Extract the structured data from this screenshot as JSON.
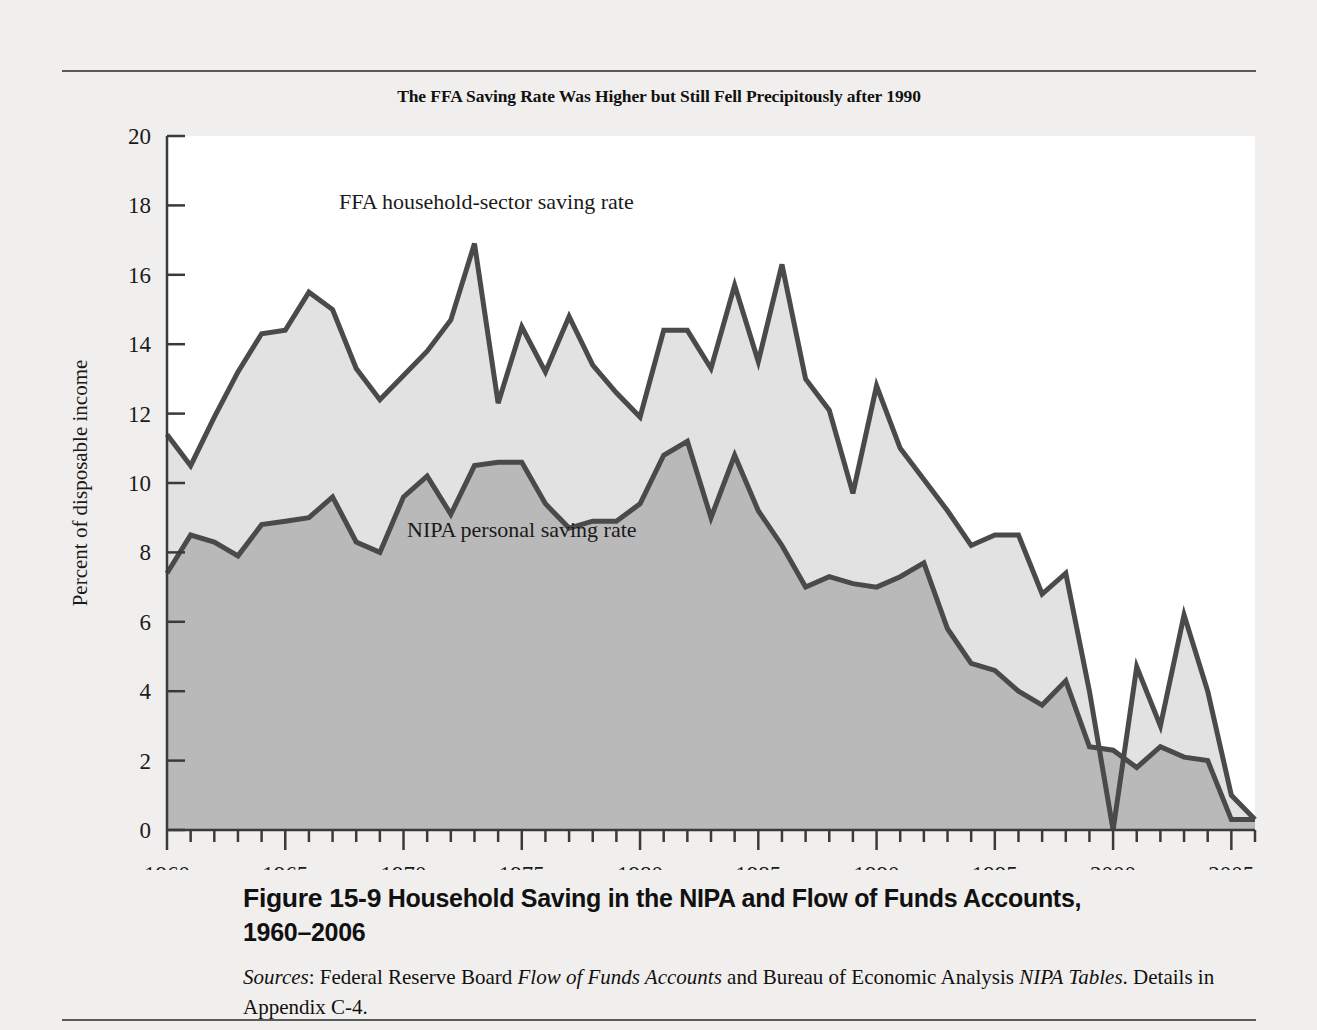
{
  "figure": {
    "chart_title": "The FFA Saving Rate Was Higher but Still Fell Precipitously after 1990",
    "fig_number": "Figure 15-9",
    "fig_caption_line1": "Household Saving in the NIPA and Flow of Funds Accounts,",
    "fig_caption_line2": "1960–2006",
    "sources_label": "Sources",
    "sources_text_1": ": Federal Reserve Board ",
    "sources_italic_1": "Flow of Funds Accounts",
    "sources_text_2": " and Bureau of Economic Analysis ",
    "sources_italic_2": "NIPA",
    "sources_italic_3": "Tables",
    "sources_text_3": ". Details in Appendix C-4."
  },
  "colors": {
    "page_background": "#f0efed",
    "plot_background": "#ffffff",
    "ffa_area_fill": "#e2e2e2",
    "nipa_area_fill": "#b9b9b9",
    "line_stroke": "#4a4a4a",
    "axis_stroke": "#3a3a3a",
    "text": "#1a1a1a",
    "rule": "#5a5a5a"
  },
  "chart_data": {
    "type": "area",
    "title": "The FFA Saving Rate Was Higher but Still Fell Precipitously after 1990",
    "xlabel": "",
    "ylabel": "Percent of disposable income",
    "xlim": [
      1960,
      2006
    ],
    "ylim": [
      0,
      20
    ],
    "y_ticks": [
      0,
      2,
      4,
      6,
      8,
      10,
      12,
      14,
      16,
      18,
      20
    ],
    "y_tick_labels": [
      "0",
      "2",
      "4",
      "6",
      "8",
      "10",
      "12",
      "14",
      "16",
      "18",
      "20"
    ],
    "x_ticks": [
      1960,
      1965,
      1970,
      1975,
      1980,
      1985,
      1990,
      1995,
      2000,
      2005
    ],
    "x_tick_labels": [
      "1960",
      "1965",
      "1970",
      "1975",
      "1980",
      "1985",
      "1990",
      "1995",
      "2000",
      "2005"
    ],
    "x_minor_tick_step": 1,
    "grid": false,
    "legend_position": "inline-annotations",
    "x": [
      1960,
      1961,
      1962,
      1963,
      1964,
      1965,
      1966,
      1967,
      1968,
      1969,
      1970,
      1971,
      1972,
      1973,
      1974,
      1975,
      1976,
      1977,
      1978,
      1979,
      1980,
      1981,
      1982,
      1983,
      1984,
      1985,
      1986,
      1987,
      1988,
      1989,
      1990,
      1991,
      1992,
      1993,
      1994,
      1995,
      1996,
      1997,
      1998,
      1999,
      2000,
      2001,
      2002,
      2003,
      2004,
      2005,
      2006
    ],
    "series": [
      {
        "name": "FFA household-sector saving rate",
        "label": "FFA household-sector saving rate",
        "fill": "#e2e2e2",
        "values": [
          11.4,
          10.5,
          11.9,
          13.2,
          14.3,
          14.4,
          15.5,
          15.0,
          13.3,
          12.4,
          13.1,
          13.8,
          14.7,
          16.9,
          12.3,
          14.5,
          13.2,
          14.8,
          13.4,
          12.6,
          11.9,
          14.4,
          14.4,
          13.3,
          15.7,
          13.5,
          16.3,
          13.0,
          12.1,
          9.7,
          12.8,
          11.0,
          10.1,
          9.2,
          8.2,
          8.5,
          8.5,
          6.8,
          7.4,
          4.0,
          0.0,
          4.7,
          3.0,
          6.2,
          4.0,
          1.0,
          0.3
        ]
      },
      {
        "name": "NIPA personal saving rate",
        "label": "NIPA personal saving rate",
        "fill": "#b9b9b9",
        "values": [
          7.4,
          8.5,
          8.3,
          7.9,
          8.8,
          8.9,
          9.0,
          9.6,
          8.3,
          8.0,
          9.6,
          10.2,
          9.1,
          10.5,
          10.6,
          10.6,
          9.4,
          8.7,
          8.9,
          8.9,
          9.4,
          10.8,
          11.2,
          9.0,
          10.8,
          9.2,
          8.2,
          7.0,
          7.3,
          7.1,
          7.0,
          7.3,
          7.7,
          5.8,
          4.8,
          4.6,
          4.0,
          3.6,
          4.3,
          2.4,
          2.3,
          1.8,
          2.4,
          2.1,
          2.0,
          0.3,
          0.3
        ]
      }
    ],
    "annotations": [
      {
        "text": "FFA household-sector saving rate",
        "x": 1973.5,
        "y": 17.9
      },
      {
        "text": "NIPA personal saving rate",
        "x": 1975.0,
        "y": 8.45
      }
    ]
  }
}
